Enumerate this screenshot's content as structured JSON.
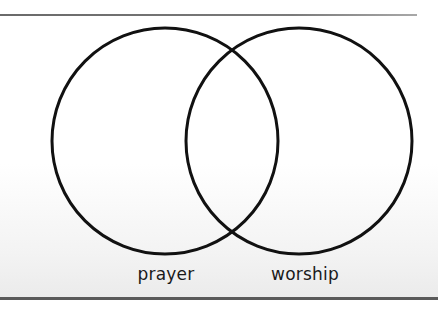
{
  "diagram": {
    "type": "venn",
    "sets": [
      {
        "label": "prayer",
        "cx": 165,
        "cy": 141,
        "r": 113
      },
      {
        "label": "worship",
        "cx": 299,
        "cy": 141,
        "r": 113
      }
    ],
    "stroke_color": "#111111",
    "stroke_width": 3
  }
}
